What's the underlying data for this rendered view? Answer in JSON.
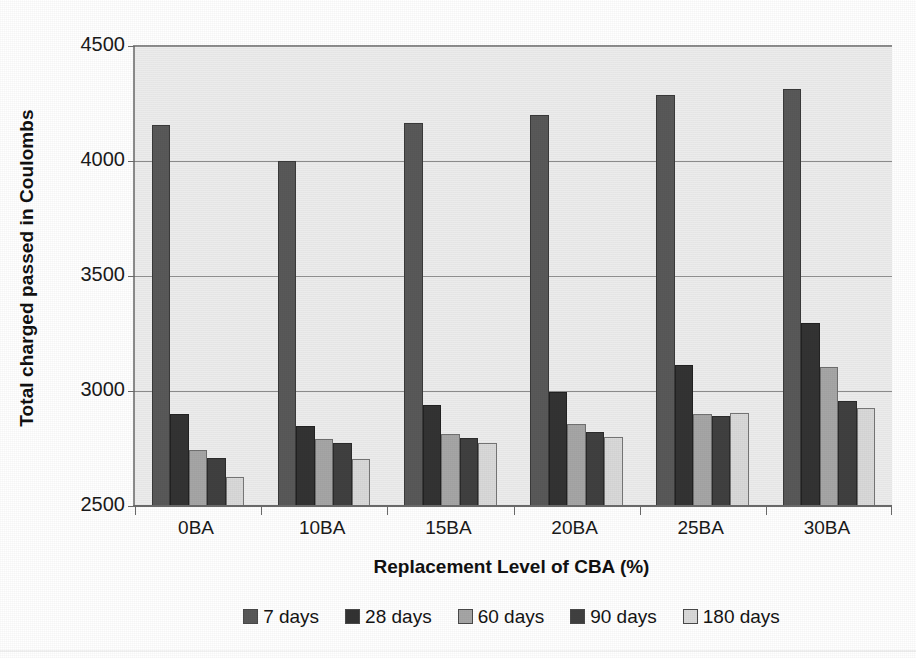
{
  "chart_data": {
    "type": "bar",
    "title": "",
    "xlabel": "Replacement Level of CBA (%)",
    "ylabel": "Total charged passed in Coulombs",
    "categories": [
      "0BA",
      "10BA",
      "15BA",
      "20BA",
      "25BA",
      "30BA"
    ],
    "ylim": [
      2500,
      4500
    ],
    "yticks": [
      2500,
      3000,
      3500,
      4000,
      4500
    ],
    "ytick_labels": [
      "2500",
      "3000",
      "3500",
      "4000",
      "4500"
    ],
    "grid": true,
    "legend_position": "bottom",
    "series": [
      {
        "name": "7 days",
        "color": "#595959",
        "values": [
          4155,
          4000,
          4165,
          4200,
          4285,
          4315
        ]
      },
      {
        "name": "28 days",
        "color": "#333333",
        "values": [
          2900,
          2850,
          2940,
          2995,
          3115,
          3295
        ]
      },
      {
        "name": "60 days",
        "color": "#a6a6a6",
        "values": [
          2745,
          2790,
          2815,
          2855,
          2900,
          3105
        ]
      },
      {
        "name": "90 days",
        "color": "#404040",
        "values": [
          2710,
          2775,
          2795,
          2820,
          2890,
          2955
        ]
      },
      {
        "name": "180 days",
        "color": "#d9d9d9",
        "values": [
          2625,
          2705,
          2775,
          2800,
          2905,
          2925
        ]
      }
    ]
  },
  "figure": {
    "plot_background": "#ebebeb",
    "axis_color": "#8c8c8c",
    "grid_color": "#8f8f8f"
  }
}
